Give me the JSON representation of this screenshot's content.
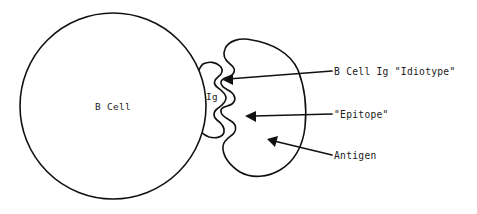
{
  "figure": {
    "type": "biology-diagram",
    "background_color": "#ffffff",
    "stroke_color": "#111111"
  },
  "shapes": {
    "b_cell": {
      "name": "B Cell",
      "label": "B Cell",
      "label_x": 113,
      "label_y": 110,
      "center_x": 113,
      "center_y": 106,
      "radius": 93
    },
    "immunoglobulin": {
      "name": "Ig",
      "label": "Ig",
      "label_x": 212,
      "label_y": 100
    },
    "antigen": {
      "name": "Antigen"
    }
  },
  "callouts": [
    {
      "id": "idiotype",
      "label": "B Cell Ig \"Idiotype\"",
      "text_x": 334,
      "text_y": 75,
      "line_x1": 332,
      "line_y1": 71,
      "line_x2": 228,
      "line_y2": 79,
      "arrow_tip_x": 223,
      "arrow_tip_y": 80,
      "has_arrow": true
    },
    {
      "id": "epitope",
      "label": "\"Epitope\"",
      "text_x": 334,
      "text_y": 118,
      "line_x1": 332,
      "line_y1": 114,
      "line_x2": 252,
      "line_y2": 116,
      "arrow_tip_x": 245,
      "arrow_tip_y": 116,
      "has_arrow": true
    },
    {
      "id": "antigen",
      "label": "Antigen",
      "text_x": 334,
      "text_y": 159,
      "line_x1": 332,
      "line_y1": 155,
      "line_x2": 275,
      "line_y2": 141,
      "arrow_tip_x": 267,
      "arrow_tip_y": 139,
      "has_arrow": true
    }
  ]
}
